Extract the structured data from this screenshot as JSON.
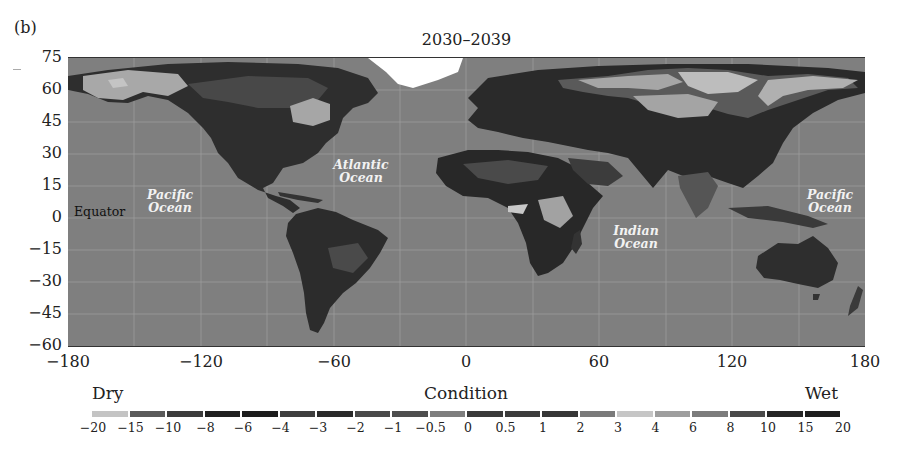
{
  "panel_label": "(b)",
  "chart_data": {
    "type": "heatmap",
    "title": "2030–2039",
    "subtitle": "",
    "xlabel": "",
    "ylabel": "",
    "x_ticks": [
      "−180",
      "−120",
      "−60",
      "0",
      "60",
      "120",
      "180"
    ],
    "x_tick_values": [
      -180,
      -120,
      -60,
      0,
      60,
      120,
      180
    ],
    "y_ticks": [
      "75",
      "60",
      "45",
      "30",
      "15",
      "0",
      "−15",
      "−30",
      "−45",
      "−60"
    ],
    "y_tick_values": [
      75,
      60,
      45,
      30,
      15,
      0,
      -15,
      -30,
      -45,
      -60
    ],
    "xlim": [
      -180,
      180
    ],
    "ylim": [
      -60,
      75
    ],
    "grid": true,
    "map_annotations": [
      {
        "text": "Equator",
        "lon": -165,
        "lat": 2
      },
      {
        "text": "Pacific Ocean",
        "lon": -138,
        "lat": 6
      },
      {
        "text": "Atlantic Ocean",
        "lon": -44,
        "lat": 22
      },
      {
        "text": "Indian Ocean",
        "lon": 75,
        "lat": -10
      },
      {
        "text": "Pacific Ocean",
        "lon": 165,
        "lat": 6
      }
    ],
    "colorbar": {
      "title": "Condition",
      "left_label": "Dry",
      "right_label": "Wet",
      "position": "bottom",
      "ticks": [
        "−20",
        "−15",
        "−10",
        "−8",
        "−6",
        "−4",
        "−3",
        "−2",
        "−1",
        "−0.5",
        "0",
        "0.5",
        "1",
        "2",
        "3",
        "4",
        "6",
        "8",
        "10",
        "15",
        "20"
      ],
      "tick_values": [
        -20,
        -15,
        -10,
        -8,
        -6,
        -4,
        -3,
        -2,
        -1,
        -0.5,
        0,
        0.5,
        1,
        2,
        3,
        4,
        6,
        8,
        10,
        15,
        20
      ],
      "segment_colors": [
        "#c4c4c4",
        "#5a5a5a",
        "#3c3c3c",
        "#202020",
        "#1c1c1c",
        "#3e3e3e",
        "#2a2a2a",
        "#4a4a4a",
        "#4e4e4e",
        "#7e7e7e",
        "#3a3a3a",
        "#3c3c3c",
        "#363636",
        "#7a7a7a",
        "#c6c6c6",
        "#9e9e9e",
        "#7c7c7c",
        "#4a4a4a",
        "#262626",
        "#1e1e1e"
      ]
    },
    "regional_summary": [
      {
        "region": "Alaska / NW Canada",
        "condition": "wet (3 to 6)"
      },
      {
        "region": "Eastern Canada (Quebec)",
        "condition": "wet (3 to 6)"
      },
      {
        "region": "USA / Mexico / Central America",
        "condition": "dry (-8 to -4)"
      },
      {
        "region": "Northern South America / Amazon",
        "condition": "dry (-8 to -4)"
      },
      {
        "region": "Europe / Mediterranean",
        "condition": "dry (-6 to -2)"
      },
      {
        "region": "Africa (Sahel, southern)",
        "condition": "dry (-10 to -3)"
      },
      {
        "region": "East Africa highlands",
        "condition": "wet (3 to 6)"
      },
      {
        "region": "Northern Russia / Siberia",
        "condition": "wet (3 to 6)"
      },
      {
        "region": "China / SE Asia",
        "condition": "dry (-8 to -3)"
      },
      {
        "region": "Australia",
        "condition": "dry (-6 to -3)"
      }
    ],
    "special_regions": [
      {
        "region": "Greenland",
        "condition": "no data (white)"
      }
    ]
  }
}
